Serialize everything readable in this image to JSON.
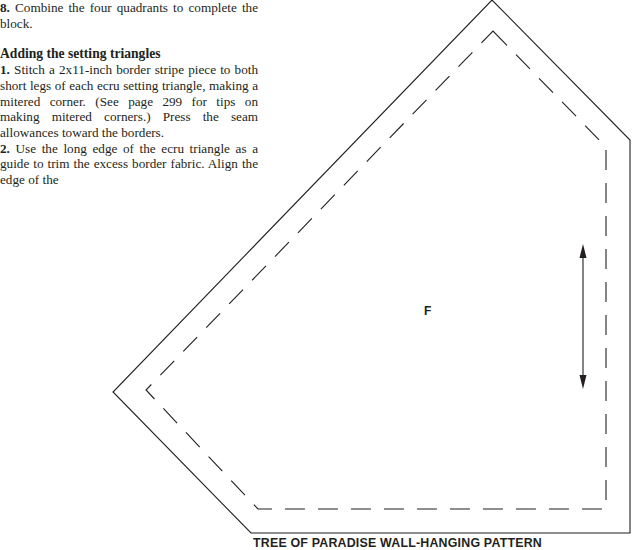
{
  "instructions": {
    "step8": {
      "number": "8.",
      "text": " Combine the four quadrants to complete the block."
    },
    "heading": "Adding the setting triangles",
    "step1": {
      "number": "1.",
      "text": " Stitch a 2x11-inch border stripe piece to both short legs of each ecru setting triangle, making a mitered corner. (See page 299 for tips on making mitered corners.) Press the seam allowances toward the borders."
    },
    "step2": {
      "number": "2.",
      "text": " Use the long edge of the ecru triangle as a guide to trim the excess border fabric. Align the edge of the"
    }
  },
  "pattern": {
    "piece_label": "F",
    "grain_arrow": "double-headed-grainline-arrow",
    "outer_cut_line": [
      [
        492,
        0
      ],
      [
        630,
        140
      ],
      [
        630,
        533
      ],
      [
        251,
        533
      ],
      [
        113,
        392
      ]
    ],
    "inner_seam_line": [
      [
        493,
        31
      ],
      [
        606,
        147
      ],
      [
        606,
        509
      ],
      [
        258,
        509
      ],
      [
        146,
        390
      ]
    ],
    "line_color": "#231f20"
  },
  "caption": "TREE OF PARADISE WALL-HANGING PATTERN"
}
